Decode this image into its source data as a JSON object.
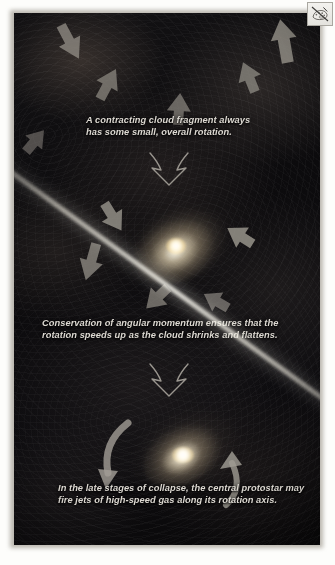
{
  "figure": {
    "background_color": "#0a0a0c",
    "caption_color": "#ddd9d2",
    "stages": [
      {
        "id": "cloud-fragment",
        "label": "Contracting cloud fragment",
        "caption": "A contracting cloud fragment always\nhas some small, overall rotation."
      },
      {
        "id": "flattened-disk",
        "label": "Flattened, faster-spinning disk",
        "caption": "Conservation of angular momentum ensures that the\nrotation speeds up as the cloud shrinks and flattens."
      },
      {
        "id": "protostar-with-jets",
        "label": "Protostar firing bipolar jets",
        "caption": "In the late stages of collapse, the central protostar may\nfire jets of high-speed gas along its rotation axis."
      }
    ],
    "transition_arrows": [
      {
        "id": "transition-1",
        "icon": "large-down-arrow-icon"
      },
      {
        "id": "transition-2",
        "icon": "large-down-arrow-icon"
      }
    ],
    "infall_arrows_count": 6,
    "rotation_arrows_count": 4,
    "jet": {
      "label": "high-speed gas jet",
      "color": "#fcfaf2",
      "axis_angle_degrees": 36
    }
  },
  "overlay": {
    "broken_image_icon": "broken-image-icon"
  }
}
